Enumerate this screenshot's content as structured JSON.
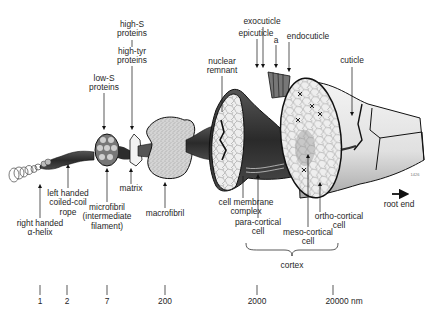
{
  "diagram": {
    "colors": {
      "ink": "#111111",
      "dark_fill": "#3a3a3a",
      "mid_fill": "#8a8a8a",
      "light_fill": "#d9d9d9",
      "cortex_fill": "#e6e6e6",
      "background": "#ffffff"
    },
    "top_labels": {
      "high_s": [
        "high-S",
        "proteins"
      ],
      "high_tyr": [
        "high-tyr",
        "proteins"
      ],
      "low_s": [
        "low-S",
        "proteins"
      ],
      "nuclear_remnant": [
        "nuclear",
        "remnant"
      ],
      "exocuticle": "exocuticle",
      "epicuticle": "epicuticle",
      "a_layer": "a",
      "endocuticle": "endocuticle",
      "cuticle": "cuticle"
    },
    "bottom_labels": {
      "alpha_helix": [
        "right handed",
        "α-helix"
      ],
      "coiled_coil": [
        "left handed",
        "coiled-coil",
        "rope"
      ],
      "microfibril": [
        "microfibril",
        "(intermediate",
        "filament)"
      ],
      "matrix": "matrix",
      "macrofibril": "macrofibril",
      "cell_membrane_complex": [
        "cell membrane",
        "complex"
      ],
      "para_cortical": [
        "para-cortical",
        "cell"
      ],
      "meso_cortical": [
        "meso-cortical",
        "cell"
      ],
      "ortho_cortical": [
        "ortho-cortical",
        "cell"
      ],
      "cortex": "cortex",
      "root_end": "root end"
    },
    "figure_code": "1426",
    "scale": {
      "unit": "nm",
      "ticks": [
        {
          "label": "1",
          "x": 40
        },
        {
          "label": "2",
          "x": 67
        },
        {
          "label": "7",
          "x": 107
        },
        {
          "label": "200",
          "x": 165
        },
        {
          "label": "2000",
          "x": 257
        },
        {
          "label": "20000 nm",
          "x": 333
        }
      ]
    }
  }
}
